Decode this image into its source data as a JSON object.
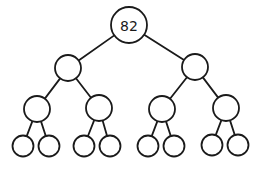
{
  "diagram": {
    "type": "binary-tree",
    "depth": 4,
    "colors": {
      "stroke": "#1a1a1a",
      "fill": "#ffffff",
      "background": "#ffffff"
    },
    "nodes": [
      {
        "id": "n0",
        "label": "82",
        "cx": 129,
        "cy": 25,
        "r": 18
      },
      {
        "id": "n1",
        "label": "",
        "cx": 68,
        "cy": 68,
        "r": 13
      },
      {
        "id": "n2",
        "label": "",
        "cx": 195,
        "cy": 67,
        "r": 13
      },
      {
        "id": "n3",
        "label": "",
        "cx": 37,
        "cy": 109,
        "r": 13
      },
      {
        "id": "n4",
        "label": "",
        "cx": 99,
        "cy": 108,
        "r": 13
      },
      {
        "id": "n5",
        "label": "",
        "cx": 162,
        "cy": 109,
        "r": 13
      },
      {
        "id": "n6",
        "label": "",
        "cx": 226,
        "cy": 108,
        "r": 13
      },
      {
        "id": "n7",
        "label": "",
        "cx": 23,
        "cy": 146,
        "r": 10.5
      },
      {
        "id": "n8",
        "label": "",
        "cx": 49,
        "cy": 146,
        "r": 10.5
      },
      {
        "id": "n9",
        "label": "",
        "cx": 84,
        "cy": 146,
        "r": 10.5
      },
      {
        "id": "n10",
        "label": "",
        "cx": 110,
        "cy": 146,
        "r": 10.5
      },
      {
        "id": "n11",
        "label": "",
        "cx": 148,
        "cy": 146,
        "r": 10.5
      },
      {
        "id": "n12",
        "label": "",
        "cx": 174,
        "cy": 146,
        "r": 10.5
      },
      {
        "id": "n13",
        "label": "",
        "cx": 212,
        "cy": 145,
        "r": 10.5
      },
      {
        "id": "n14",
        "label": "",
        "cx": 238,
        "cy": 145,
        "r": 10.5
      }
    ],
    "edges": [
      [
        "n0",
        "n1"
      ],
      [
        "n0",
        "n2"
      ],
      [
        "n1",
        "n3"
      ],
      [
        "n1",
        "n4"
      ],
      [
        "n2",
        "n5"
      ],
      [
        "n2",
        "n6"
      ],
      [
        "n3",
        "n7"
      ],
      [
        "n3",
        "n8"
      ],
      [
        "n4",
        "n9"
      ],
      [
        "n4",
        "n10"
      ],
      [
        "n5",
        "n11"
      ],
      [
        "n5",
        "n12"
      ],
      [
        "n6",
        "n13"
      ],
      [
        "n6",
        "n14"
      ]
    ]
  }
}
